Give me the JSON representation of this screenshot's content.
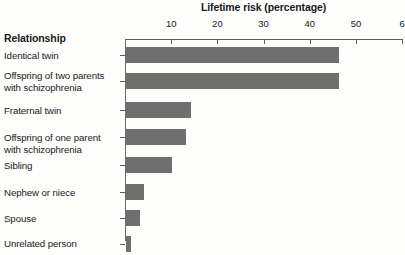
{
  "chart_data": {
    "type": "bar",
    "orientation": "horizontal",
    "title": "Lifetime risk (percentage)",
    "xlabel": "Lifetime risk (percentage)",
    "ylabel": "Relationship",
    "categories": [
      "Identical twin",
      "Offspring of two parents with schizophrenia",
      "Fraternal twin",
      "Offspring of one parent with schizophrenia",
      "Sibling",
      "Nephew or niece",
      "Spouse",
      "Unrelated person"
    ],
    "values": [
      46,
      46,
      14,
      13,
      10,
      4,
      3,
      1
    ],
    "xlim": [
      0,
      60
    ],
    "xticks": [
      0,
      10,
      20,
      30,
      40,
      50,
      60
    ],
    "xtick_labels": [
      "",
      "10",
      "20",
      "30",
      "40",
      "50",
      "6"
    ],
    "grid": false,
    "legend": false,
    "bar_color": "#6f6f6f",
    "axis_color": "#5d5d5d",
    "background": "#fdfdfc"
  },
  "axis": {
    "header_label": "Relationship",
    "title": "Lifetime risk (percentage)",
    "ticks": [
      {
        "label": "10",
        "value": 10
      },
      {
        "label": "20",
        "value": 20
      },
      {
        "label": "30",
        "value": 30
      },
      {
        "label": "40",
        "value": 40
      },
      {
        "label": "50",
        "value": 50
      },
      {
        "label": "6",
        "value": 60
      }
    ]
  },
  "rows": [
    {
      "label_line1": "Identical twin",
      "label_line2": "",
      "value": 46
    },
    {
      "label_line1": "Offspring of two parents",
      "label_line2": "with schizophrenia",
      "value": 46
    },
    {
      "label_line1": "Fraternal twin",
      "label_line2": "",
      "value": 14
    },
    {
      "label_line1": "Offspring of one parent",
      "label_line2": "with schizophrenia",
      "value": 13
    },
    {
      "label_line1": "Sibling",
      "label_line2": "",
      "value": 10
    },
    {
      "label_line1": "Nephew or niece",
      "label_line2": "",
      "value": 4
    },
    {
      "label_line1": "Spouse",
      "label_line2": "",
      "value": 3
    },
    {
      "label_line1": "Unrelated person",
      "label_line2": "",
      "value": 1
    }
  ]
}
